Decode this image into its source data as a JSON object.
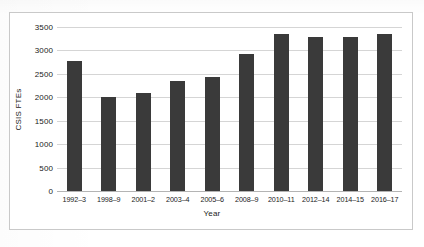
{
  "ghost_artifacts": {
    "top_left": "",
    "top_right": "",
    "bottom": ""
  },
  "chart_data": {
    "type": "bar",
    "title": "",
    "xlabel": "Year",
    "ylabel": "CSIS FTEs",
    "categories": [
      "1992–3",
      "1998–9",
      "2001–2",
      "2003–4",
      "2005–6",
      "2008–9",
      "2010–11",
      "2012–14",
      "2014–15",
      "2016–17"
    ],
    "values": [
      2780,
      2010,
      2100,
      2350,
      2430,
      2930,
      3340,
      3280,
      3285,
      3350
    ],
    "ylim": [
      0,
      3500
    ],
    "ytick_labels": [
      "3500",
      "3000",
      "2500",
      "2000",
      "1500",
      "1000",
      "500",
      "0"
    ],
    "ytick_values": [
      3500,
      3000,
      2500,
      2000,
      1500,
      1000,
      500,
      0
    ],
    "grid": true,
    "legend": "none",
    "bar_color": "#3a3a3a",
    "grid_color": "#d5d5d5",
    "axis_color": "#b4b4b4",
    "frame_color": "#c9c9c9"
  }
}
